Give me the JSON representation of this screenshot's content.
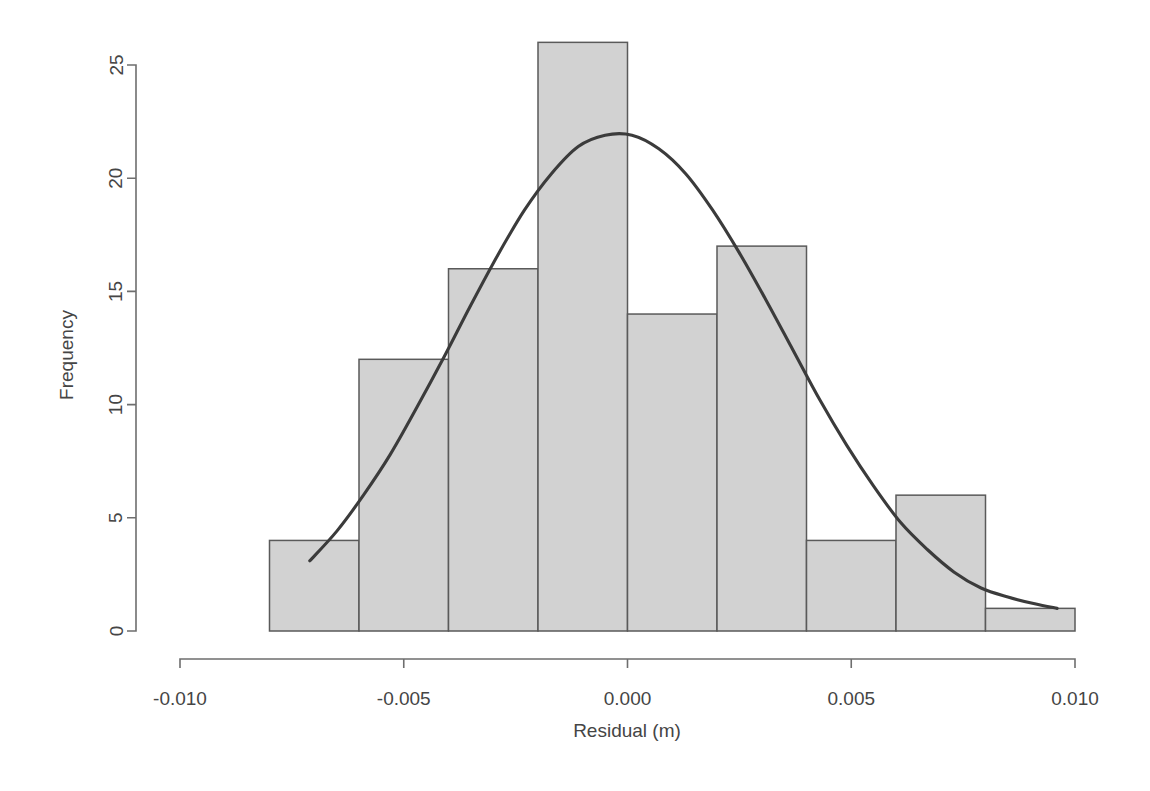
{
  "chart_data": {
    "type": "bar",
    "title": "",
    "subtitle": "",
    "xlabel": "Residual (m)",
    "ylabel": "Frequency",
    "xlim": [
      -0.01,
      0.01
    ],
    "ylim": [
      0,
      26
    ],
    "grid": false,
    "legend": null,
    "bin_width": 0.002,
    "bin_edges": [
      -0.008,
      -0.006,
      -0.004,
      -0.002,
      0.0,
      0.002,
      0.004,
      0.006,
      0.008,
      0.01
    ],
    "categories": [
      "-0.008 to -0.006",
      "-0.006 to -0.004",
      "-0.004 to -0.002",
      "-0.002 to 0.000",
      "0.000 to 0.002",
      "0.002 to 0.004",
      "0.004 to 0.006",
      "0.006 to 0.008",
      "0.008 to 0.010"
    ],
    "values": [
      4,
      12,
      16,
      26,
      14,
      17,
      4,
      6,
      1
    ],
    "total_count": 100,
    "xticks": [
      -0.01,
      -0.005,
      0.0,
      0.005,
      0.01
    ],
    "xtick_labels": [
      "-0.010",
      "-0.005",
      "0.000",
      "0.005",
      "0.010"
    ],
    "yticks": [
      0,
      5,
      10,
      15,
      20,
      25
    ],
    "ytick_labels": [
      "0",
      "5",
      "10",
      "15",
      "20",
      "25"
    ],
    "overlay": {
      "name": "normal-density-curve",
      "type": "line",
      "peak_value": 21.9,
      "peak_x": -0.0003,
      "x_start": -0.0071,
      "x_end": 0.0096,
      "points_x": [
        -0.0071,
        -0.0065,
        -0.0059,
        -0.0053,
        -0.0047,
        -0.0041,
        -0.0035,
        -0.0029,
        -0.0023,
        -0.0017,
        -0.0011,
        -0.0005,
        0.0001,
        0.0007,
        0.0013,
        0.0019,
        0.0025,
        0.0031,
        0.0037,
        0.0043,
        0.0049,
        0.0055,
        0.0061,
        0.0067,
        0.0073,
        0.0079,
        0.0085,
        0.0091,
        0.0096
      ],
      "points_y": [
        3.1,
        4.4,
        6.0,
        7.8,
        9.9,
        12.1,
        14.4,
        16.6,
        18.6,
        20.2,
        21.4,
        21.9,
        21.9,
        21.3,
        20.2,
        18.6,
        16.7,
        14.6,
        12.4,
        10.2,
        8.2,
        6.4,
        4.8,
        3.6,
        2.6,
        1.9,
        1.5,
        1.2,
        1.0
      ]
    }
  },
  "axes": {
    "y_axis_title": "Frequency",
    "x_axis_title": "Residual (m)"
  },
  "colors": {
    "bar_fill": "#d2d2d2",
    "bar_stroke": "#5a5a5a",
    "curve": "#3b3b3b",
    "axis": "#6e6e6e",
    "text": "#454545",
    "background": "#ffffff"
  }
}
